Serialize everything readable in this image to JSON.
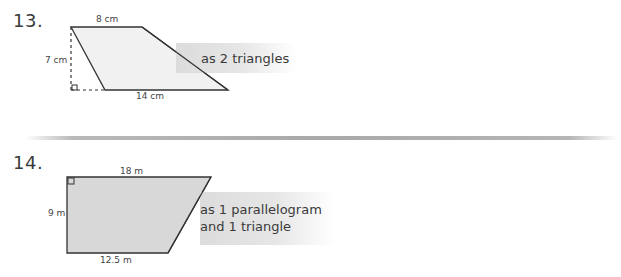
{
  "problems": [
    {
      "number": "13.",
      "shape": "trapezoid",
      "dimensions": {
        "top": "8 cm",
        "height": "7 cm",
        "bottom": "14 cm"
      },
      "instruction": "as 2 triangles",
      "fill_color": "#f0f0f0"
    },
    {
      "number": "14.",
      "shape": "right trapezoid",
      "dimensions": {
        "top": "18 m",
        "height": "9 m",
        "bottom": "12.5 m"
      },
      "instruction_line1": "as 1 parallelogram",
      "instruction_line2": "and 1 triangle",
      "fill_color": "#d6d6d6"
    }
  ]
}
